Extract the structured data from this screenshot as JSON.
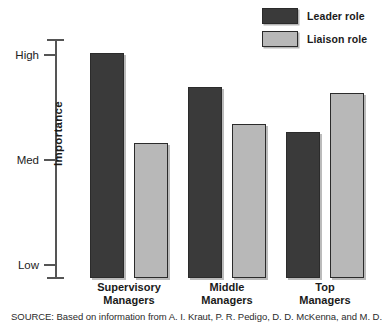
{
  "chart_data": {
    "type": "bar",
    "title": "",
    "xlabel": "",
    "ylabel": "Importance",
    "categories": [
      "Supervisory Managers",
      "Middle Managers",
      "Top Managers"
    ],
    "category_lines": [
      [
        "Supervisory",
        "Managers"
      ],
      [
        "Middle",
        "Managers"
      ],
      [
        "Top",
        "Managers"
      ]
    ],
    "ytick_labels": [
      "High",
      "Med",
      "Low"
    ],
    "ytick_values": [
      2,
      1,
      0
    ],
    "ylim": [
      0,
      2.2
    ],
    "grid": false,
    "legend_position": "top-right",
    "series": [
      {
        "name": "Leader role",
        "color": "#3a3a3a",
        "values": [
          2.02,
          1.7,
          1.27
        ]
      },
      {
        "name": "Liaison role",
        "color": "#b8b8b8",
        "values": [
          1.16,
          1.34,
          1.64
        ]
      }
    ]
  },
  "legend": {
    "items": [
      {
        "label": "Leader role",
        "color": "#3a3a3a"
      },
      {
        "label": "Liaison role",
        "color": "#b8b8b8"
      }
    ]
  },
  "axis": {
    "y_title": "Importance",
    "ticks": [
      {
        "label": "High",
        "value": 2
      },
      {
        "label": "Med",
        "value": 1
      },
      {
        "label": "Low",
        "value": 0
      }
    ]
  },
  "source": {
    "text": "SOURCE: Based on information from A. I. Kraut, P. R. Pedigo, D. D. McKenna, and M. D."
  }
}
